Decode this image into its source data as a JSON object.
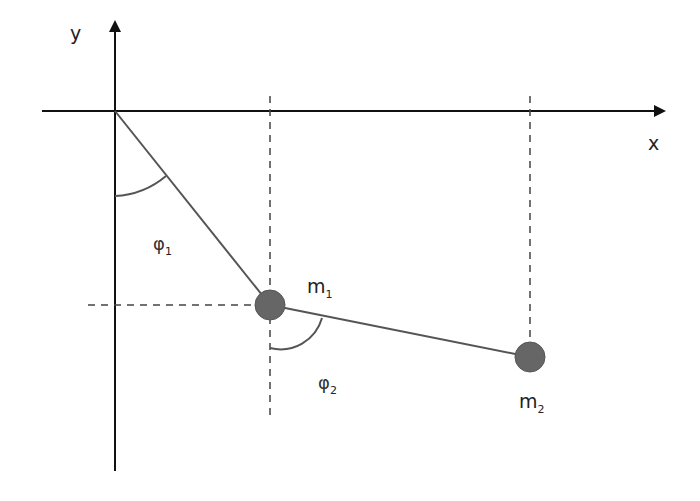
{
  "diagram": {
    "axes": {
      "x_label": "x",
      "y_label": "y",
      "origin": [
        115,
        111
      ]
    },
    "masses": [
      {
        "label": "m",
        "subscript": "1",
        "position": [
          270,
          305
        ],
        "radius": 16
      },
      {
        "label": "m",
        "subscript": "2",
        "position": [
          530,
          357
        ],
        "radius": 16
      }
    ],
    "angles": [
      {
        "label": "φ",
        "subscript": "1",
        "vertex": [
          115,
          111
        ],
        "from": "vertical",
        "to": "rod-1"
      },
      {
        "label": "φ",
        "subscript": "2",
        "vertex": [
          270,
          305
        ],
        "from": "vertical",
        "to": "rod-2"
      }
    ],
    "colors": {
      "axis": "#111111",
      "rod": "#555555",
      "mass_fill": "#666666",
      "dashed": "#444444",
      "background": "#ffffff"
    }
  }
}
